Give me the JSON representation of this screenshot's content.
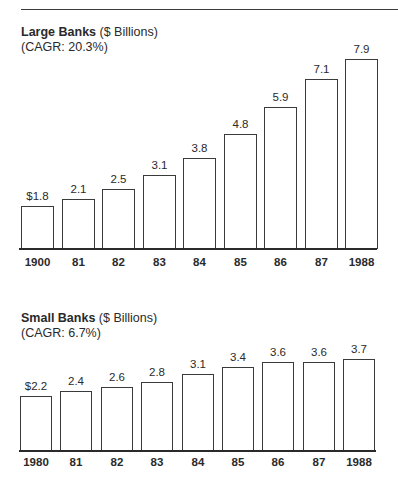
{
  "page": {
    "header_rule": true
  },
  "chart_data": [
    {
      "type": "bar",
      "title": "Large Banks",
      "title_unit": "($ Billions)",
      "subtitle": "(CAGR:  20.3%)",
      "categories": [
        "1900",
        "81",
        "82",
        "83",
        "84",
        "85",
        "86",
        "87",
        "1988"
      ],
      "values": [
        1.8,
        2.1,
        2.5,
        3.1,
        3.8,
        4.8,
        5.9,
        7.1,
        7.9
      ],
      "value_labels": [
        "$1.8",
        "2.1",
        "2.5",
        "3.1",
        "3.8",
        "4.8",
        "5.9",
        "7.1",
        "7.9"
      ],
      "xlabel": "",
      "ylabel": "",
      "ylim": [
        0,
        8
      ],
      "grid": false,
      "legend": "none"
    },
    {
      "type": "bar",
      "title": "Small Banks",
      "title_unit": "($ Billions)",
      "subtitle": "(CAGR:  6.7%)",
      "categories": [
        "1980",
        "81",
        "82",
        "83",
        "84",
        "85",
        "86",
        "87",
        "1988"
      ],
      "values": [
        2.2,
        2.4,
        2.6,
        2.8,
        3.1,
        3.4,
        3.6,
        3.6,
        3.7
      ],
      "value_labels": [
        "$2.2",
        "2.4",
        "2.6",
        "2.8",
        "3.1",
        "3.4",
        "3.6",
        "3.6",
        "3.7"
      ],
      "xlabel": "",
      "ylabel": "",
      "ylim": [
        0,
        4
      ],
      "grid": false,
      "legend": "none"
    }
  ]
}
